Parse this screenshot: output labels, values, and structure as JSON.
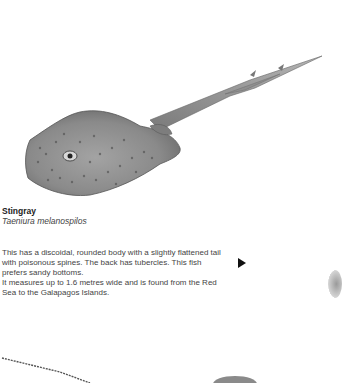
{
  "species": {
    "common_name": "Stingray",
    "latin_name": "Taeniura melanospilos",
    "description_lines": [
      "This has a discoidal, rounded body with a slightly flattened tail with poisonous spines. The back has tubercles. This fish prefers sandy bottoms.",
      "It measures up to 1.6 metres wide and is found from the Red Sea to the Galapagos Islands."
    ]
  },
  "navigation": {
    "next_icon": "play-triangle-icon"
  },
  "illustration": {
    "subject": "stingray-illustration"
  },
  "colors": {
    "background": "#ffffff",
    "text": "#444444",
    "title": "#222222",
    "arrow": "#111111"
  }
}
